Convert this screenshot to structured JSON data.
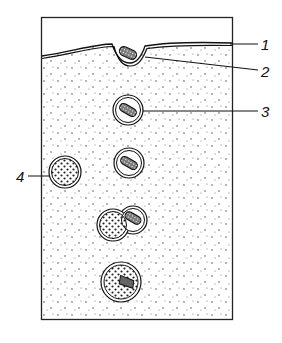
{
  "diagram": {
    "type": "phagocytosis-stages",
    "labels": [
      {
        "id": "1",
        "text": "1",
        "target": "cell membrane"
      },
      {
        "id": "2",
        "text": "2",
        "target": "membrane invagination around particle"
      },
      {
        "id": "3",
        "text": "3",
        "target": "phagosome"
      },
      {
        "id": "4",
        "text": "4",
        "target": "lysosome"
      }
    ],
    "stages": [
      "particle attaches to membrane",
      "membrane invaginates",
      "phagosome formed",
      "phagosome in cytoplasm",
      "lysosome fuses with phagosome",
      "phagolysosome digesting particle"
    ]
  }
}
